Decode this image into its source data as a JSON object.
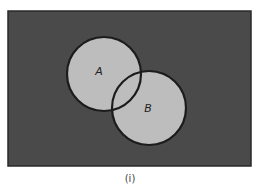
{
  "diagram": {
    "type": "venn",
    "universe": {
      "x": 8,
      "y": 11,
      "width": 243,
      "height": 155,
      "fill": "#4a4a4a",
      "stroke": "#2a2a2a"
    },
    "sets": [
      {
        "label": "A",
        "cx": 104,
        "cy": 74,
        "r": 37,
        "fill": "#bdbdbd",
        "stroke": "#1c1c1c",
        "label_x": 99,
        "label_y": 75
      },
      {
        "label": "B",
        "cx": 149,
        "cy": 108,
        "r": 37,
        "fill": "#bdbdbd",
        "stroke": "#1c1c1c",
        "label_x": 148,
        "label_y": 112
      }
    ],
    "caption": "(i)"
  }
}
